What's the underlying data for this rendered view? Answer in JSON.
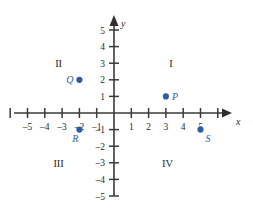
{
  "chart_data": {
    "type": "scatter",
    "title": "",
    "xlabel": "x",
    "ylabel": "y",
    "xlim": [
      -6,
      6
    ],
    "ylim": [
      -5,
      5
    ],
    "grid": false,
    "legend": "none",
    "x_ticks": [
      -5,
      -4,
      -3,
      -2,
      -1,
      1,
      2,
      3,
      4,
      5
    ],
    "x_tick_labels": [
      "–5",
      "–4",
      "–3",
      "–2",
      "–1",
      "1",
      "2",
      "3",
      "4",
      "5"
    ],
    "y_ticks": [
      5,
      4,
      3,
      2,
      1,
      -1,
      -2,
      -3,
      -4,
      -5
    ],
    "y_tick_labels": [
      "5",
      "4",
      "3",
      "2",
      "1",
      "–1",
      "–2",
      "–3",
      "–4",
      "–5"
    ],
    "points": [
      {
        "label": "P",
        "x": 3,
        "y": 1,
        "label_side": "right"
      },
      {
        "label": "Q",
        "x": -2,
        "y": 2,
        "label_side": "left"
      },
      {
        "label": "R",
        "x": -2,
        "y": -1,
        "label_side": "below-left"
      },
      {
        "label": "S",
        "x": 5,
        "y": -1,
        "label_side": "below-right"
      }
    ],
    "quadrants": [
      {
        "label": "I",
        "x": 3.3,
        "y": 3
      },
      {
        "label": "II",
        "x": -3.2,
        "y": 3
      },
      {
        "label": "III",
        "x": -3.2,
        "y": -3
      },
      {
        "label": "IV",
        "x": 3.1,
        "y": -3
      }
    ],
    "point_color": "#2a5caa",
    "axis_color": "#3a3a3a"
  }
}
